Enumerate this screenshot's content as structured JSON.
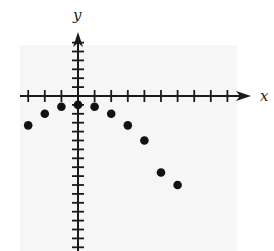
{
  "chart_data": {
    "type": "scatter",
    "title": "",
    "xlabel": "x",
    "ylabel": "y",
    "x_tick_unit": 1,
    "y_tick_unit": 1,
    "xlim": [
      -3.5,
      10.2
    ],
    "ylim": [
      -17.5,
      7
    ],
    "grid": false,
    "tick_labels_shown": false,
    "points": [
      {
        "x": -3,
        "y": -3.3
      },
      {
        "x": -2,
        "y": -2
      },
      {
        "x": -1,
        "y": -1.2
      },
      {
        "x": 0,
        "y": -1
      },
      {
        "x": 1,
        "y": -1.2
      },
      {
        "x": 2,
        "y": -2
      },
      {
        "x": 3,
        "y": -3.3
      },
      {
        "x": 4,
        "y": -5
      },
      {
        "x": 5,
        "y": -8.6
      },
      {
        "x": 6,
        "y": -10
      }
    ],
    "x": [
      -3,
      -2,
      -1,
      0,
      1,
      2,
      3,
      4,
      5,
      6
    ],
    "values": [
      -3.3,
      -2,
      -1.2,
      -1,
      -1.2,
      -2,
      -3.3,
      -5,
      -8.6,
      -10
    ]
  },
  "style": {
    "background": "#ffffff",
    "plot_background": "#f6f6f6",
    "axis_color": "#1a1a1a",
    "point_color": "#111111"
  },
  "layout": {
    "origin_px": [
      78,
      96
    ],
    "x_unit_px": 16.6,
    "y_unit_px": 8.9,
    "x_ticks": [
      -3,
      -2,
      -1,
      1,
      2,
      3,
      4,
      5,
      6,
      7,
      8,
      9
    ],
    "y_ticks_min": -17,
    "y_ticks_max": 6,
    "plot_region_px": {
      "x": 20,
      "y": 45,
      "w": 217,
      "h": 206
    }
  }
}
